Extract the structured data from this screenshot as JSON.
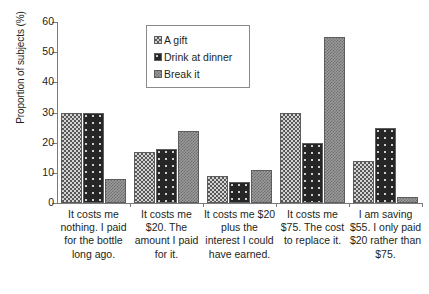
{
  "chart_data": {
    "type": "bar",
    "title": "",
    "xlabel": "",
    "ylabel": "Proportion of subjects (%)",
    "ylim": [
      0,
      60
    ],
    "yticks": [
      0,
      10,
      20,
      30,
      40,
      50,
      60
    ],
    "grid": false,
    "legend_position": "top-center",
    "categories": [
      "It costs me nothing. I paid for the bottle long ago.",
      "It costs me $20. The amount I paid for it.",
      "It costs me $20 plus the interest I could have earned.",
      "It costs me $75. The cost to replace it.",
      "I am saving $55. I only paid $20 rather than $75."
    ],
    "series": [
      {
        "name": "A gift",
        "values": [
          30,
          17,
          9,
          30,
          14
        ]
      },
      {
        "name": "Drink at dinner",
        "values": [
          30,
          18,
          7,
          20,
          25
        ]
      },
      {
        "name": "Break it",
        "values": [
          8,
          24,
          11,
          55,
          2
        ]
      }
    ]
  },
  "legend": {
    "items": [
      {
        "label": "A gift"
      },
      {
        "label": "Drink at dinner"
      },
      {
        "label": "Break it"
      }
    ]
  },
  "axis": {
    "y_title": "Proportion of subjects (%)",
    "y_tick_labels": [
      "60",
      "50",
      "40",
      "30",
      "20",
      "10",
      "0"
    ]
  },
  "category_labels": [
    "It costs me nothing. I paid for the bottle long ago.",
    "It costs me $20. The amount I paid for it.",
    "It costs me $20 plus the interest I could have earned.",
    "It costs me $75. The cost to replace it.",
    "I am saving $55. I only paid $20 rather than $75."
  ]
}
